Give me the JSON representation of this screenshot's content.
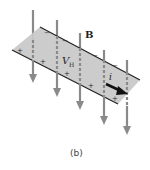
{
  "figure": {
    "caption": "(b)",
    "labels": {
      "field": "B",
      "hall_voltage_main": "V",
      "hall_voltage_sub": "H",
      "current": "i"
    },
    "charges": {
      "positive": "+",
      "negative": "−"
    },
    "colors": {
      "plate": "#c8c8c8",
      "plate_edge": "#222222",
      "field_arrow": "#8a8a8a",
      "current_arrow": "#111111"
    }
  }
}
